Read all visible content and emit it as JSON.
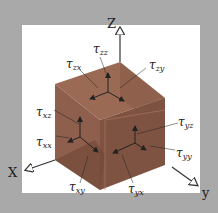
{
  "diagram": {
    "axes": {
      "z": "Z",
      "x": "X",
      "y": "y"
    },
    "labels": {
      "tzz": {
        "sym": "τ",
        "sub": "zz"
      },
      "tzx": {
        "sym": "τ",
        "sub": "zx"
      },
      "tzy": {
        "sym": "τ",
        "sub": "zy"
      },
      "txz": {
        "sym": "τ",
        "sub": "xz"
      },
      "txx": {
        "sym": "τ",
        "sub": "xx"
      },
      "tyz": {
        "sym": "τ",
        "sub": "yz"
      },
      "tyy": {
        "sym": "τ",
        "sub": "yy"
      },
      "txy": {
        "sym": "τ",
        "sub": "xy"
      },
      "tyx": {
        "sym": "τ",
        "sub": "yx"
      }
    },
    "colors": {
      "background": "#a9a9a9",
      "panel": "#ffffff",
      "top_face": "#9a6a55",
      "left_face": "#8e5f4c",
      "right_face": "#7f5342",
      "arrow": "#222222"
    }
  }
}
